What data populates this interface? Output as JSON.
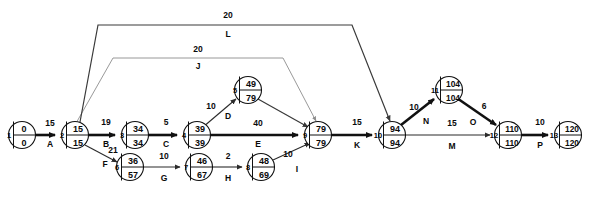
{
  "diagram": {
    "type": "pert-cpm-activity-on-arrow-network",
    "nodes": [
      {
        "id": "1",
        "label": "1",
        "early": "0",
        "late": "0",
        "cx": 22,
        "cy": 135,
        "r": 13.5
      },
      {
        "id": "2",
        "label": "2",
        "early": "15",
        "late": "15",
        "cx": 75,
        "cy": 135,
        "r": 13.5
      },
      {
        "id": "3",
        "label": "3",
        "early": "34",
        "late": "34",
        "cx": 135,
        "cy": 135,
        "r": 13.5
      },
      {
        "id": "4",
        "label": "4",
        "early": "39",
        "late": "39",
        "cx": 197,
        "cy": 135,
        "r": 13.5
      },
      {
        "id": "5",
        "label": "5",
        "early": "49",
        "late": "79",
        "cx": 248,
        "cy": 90,
        "r": 13.5
      },
      {
        "id": "6",
        "label": "6",
        "early": "36",
        "late": "57",
        "cx": 130,
        "cy": 167,
        "r": 13.5
      },
      {
        "id": "7",
        "label": "7",
        "early": "46",
        "late": "67",
        "cx": 199,
        "cy": 167,
        "r": 13.5
      },
      {
        "id": "8",
        "label": "8",
        "early": "48",
        "late": "69",
        "cx": 261,
        "cy": 167,
        "r": 13.5
      },
      {
        "id": "9",
        "label": "9",
        "early": "79",
        "late": "79",
        "cx": 318,
        "cy": 135,
        "r": 13.5
      },
      {
        "id": "10",
        "label": "10",
        "early": "94",
        "late": "94",
        "cx": 392,
        "cy": 135,
        "r": 13.5
      },
      {
        "id": "11",
        "label": "11",
        "early": "104",
        "late": "104",
        "cx": 449,
        "cy": 90,
        "r": 13.5
      },
      {
        "id": "12",
        "label": "12",
        "early": "110",
        "late": "110",
        "cx": 508,
        "cy": 135,
        "r": 13.5
      },
      {
        "id": "13",
        "label": "13",
        "early": "120",
        "late": "120",
        "cx": 568,
        "cy": 135,
        "r": 13.5
      }
    ],
    "activities": [
      {
        "name": "A",
        "duration": "15",
        "from": "1",
        "to": "2",
        "critical": true,
        "dur_x": 50,
        "dur_y": 126,
        "act_x": 50,
        "act_y": 146
      },
      {
        "name": "B",
        "duration": "19",
        "from": "2",
        "to": "3",
        "critical": true,
        "dur_x": 106,
        "dur_y": 125,
        "act_x": 106,
        "act_y": 146
      },
      {
        "name": "C",
        "duration": "5",
        "from": "3",
        "to": "4",
        "critical": true,
        "dur_x": 166,
        "dur_y": 125,
        "act_x": 166,
        "act_y": 146
      },
      {
        "name": "D",
        "duration": "10",
        "from": "4",
        "to": "5",
        "critical": false,
        "dur_x": 213,
        "dur_y": 106,
        "act_x": 229,
        "act_y": 117
      },
      {
        "name": "E",
        "duration": "40",
        "from": "4",
        "to": "9",
        "critical": true,
        "dur_x": 258,
        "dur_y": 126,
        "act_x": 258,
        "act_y": 146
      },
      {
        "name": "F",
        "duration": "21",
        "from": "2",
        "to": "6",
        "critical": false,
        "dur_x": 112,
        "dur_y": 152,
        "act_x": 104,
        "act_y": 165
      },
      {
        "name": "G",
        "duration": "10",
        "from": "6",
        "to": "7",
        "critical": false,
        "dur_x": 164,
        "dur_y": 160,
        "act_x": 164,
        "act_y": 180
      },
      {
        "name": "H",
        "duration": "2",
        "from": "7",
        "to": "8",
        "critical": false,
        "dur_x": 230,
        "dur_y": 160,
        "act_x": 230,
        "act_y": 180
      },
      {
        "name": "I",
        "duration": "10",
        "from": "8",
        "to": "9",
        "critical": false,
        "dur_x": 288,
        "dur_y": 156,
        "act_x": 296,
        "act_y": 171
      },
      {
        "name": "J",
        "duration": "20",
        "from": "2",
        "to": "9",
        "critical": false,
        "dur_x": 198,
        "dur_y": 51,
        "act_x": 198,
        "act_y": 67
      },
      {
        "name": "K",
        "duration": "15",
        "from": "9",
        "to": "10",
        "critical": true,
        "dur_x": 357,
        "dur_y": 125,
        "act_x": 357,
        "act_y": 147
      },
      {
        "name": "L",
        "duration": "20",
        "from": "2",
        "to": "10",
        "critical": false,
        "dur_x": 228,
        "dur_y": 18,
        "act_x": 228,
        "act_y": 36
      },
      {
        "name": "M",
        "duration": "15",
        "from": "10",
        "to": "12",
        "critical": false,
        "dur_x": 452,
        "dur_y": 126,
        "act_x": 452,
        "act_y": 148
      },
      {
        "name": "N",
        "duration": "10",
        "from": "10",
        "to": "11",
        "critical": true,
        "dur_x": 415,
        "dur_y": 108,
        "act_x": 427,
        "act_y": 122
      },
      {
        "name": "O",
        "duration": "6",
        "from": "11",
        "to": "12",
        "critical": true,
        "dur_x": 483,
        "dur_y": 107,
        "act_x": 473,
        "act_y": 123
      },
      {
        "name": "P",
        "duration": "10",
        "from": "12",
        "to": "13",
        "critical": true,
        "dur_x": 540,
        "dur_y": 125,
        "act_x": 540,
        "act_y": 147
      }
    ],
    "colors": {
      "critical_path": "#111111",
      "normal_edge": "#2b2b2b",
      "light_edge": "#8d8d8d",
      "node_fill": "#ffffff",
      "background": "#ffffff"
    }
  }
}
